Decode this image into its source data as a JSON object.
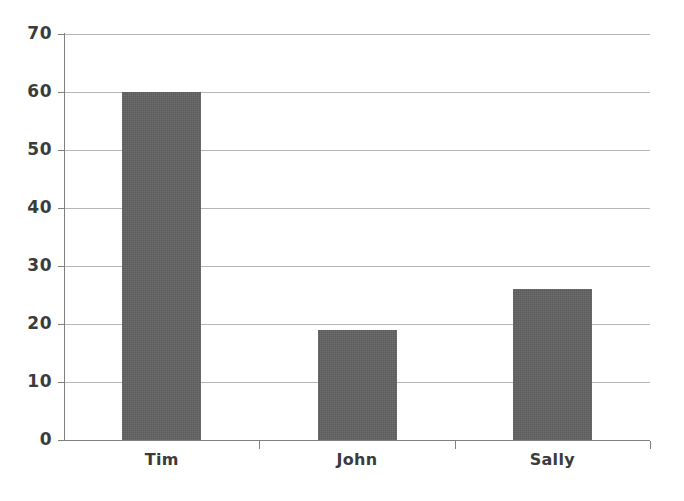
{
  "chart_data": {
    "type": "bar",
    "title": "",
    "subtitle": "",
    "xlabel": "",
    "ylabel": "",
    "categories": [
      "Tim",
      "John",
      "Sally"
    ],
    "values": [
      60,
      19,
      26
    ],
    "series": [
      {
        "name": "",
        "values": [
          60,
          19,
          26
        ]
      }
    ],
    "ylim": [
      0,
      70
    ],
    "ytick_labels": [
      "0",
      "10",
      "20",
      "30",
      "40",
      "50",
      "60",
      "70"
    ],
    "ytick_values": [
      0,
      10,
      20,
      30,
      40,
      50,
      60,
      70
    ],
    "grid": "horizontal",
    "legend": "none",
    "bar_color": "#5b5b5b",
    "gridline_color": "#a9a9a9",
    "axis_color": "#808080",
    "text_color": "#3b3b3b",
    "background": "#ffffff"
  }
}
